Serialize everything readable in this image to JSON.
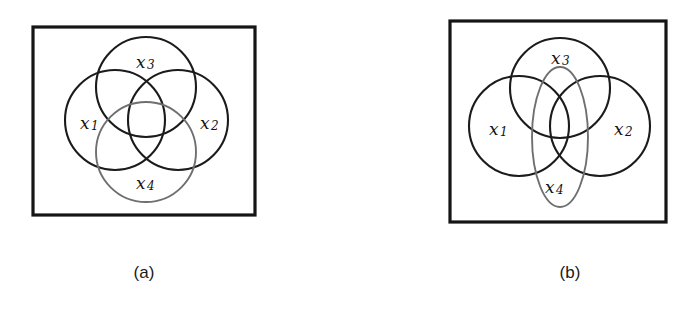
{
  "figure": {
    "background_color": "#ffffff",
    "stroke_dark": "#1b1b1b",
    "stroke_light": "#6f6f6f",
    "frame_color": "#151515",
    "panels": [
      {
        "id": "panel-a",
        "caption": "(a)",
        "caption_x": 144,
        "caption_y": 278,
        "frame": {
          "x": 33,
          "y": 27,
          "width": 222,
          "height": 188
        },
        "shapes": [
          {
            "name": "x1",
            "type": "circle",
            "cx": 115,
            "cy": 120,
            "r": 50,
            "tone": "dark"
          },
          {
            "name": "x2",
            "type": "circle",
            "cx": 178,
            "cy": 120,
            "r": 50,
            "tone": "dark"
          },
          {
            "name": "x3",
            "type": "circle",
            "cx": 146,
            "cy": 87,
            "r": 50,
            "tone": "dark"
          },
          {
            "name": "x4",
            "type": "circle",
            "cx": 146,
            "cy": 152,
            "r": 50,
            "tone": "light"
          }
        ],
        "labels": [
          {
            "base": "x",
            "sub": "1",
            "x": 80,
            "y": 124
          },
          {
            "base": "x",
            "sub": "2",
            "x": 200,
            "y": 124
          },
          {
            "base": "x",
            "sub": "3",
            "x": 136,
            "y": 63
          },
          {
            "base": "x",
            "sub": "4",
            "x": 136,
            "y": 184
          }
        ]
      },
      {
        "id": "panel-b",
        "caption": "(b)",
        "caption_x": 570,
        "caption_y": 278,
        "frame": {
          "x": 450,
          "y": 21,
          "width": 216,
          "height": 201
        },
        "shapes": [
          {
            "name": "x1",
            "type": "circle",
            "cx": 519,
            "cy": 126,
            "r": 50,
            "tone": "dark"
          },
          {
            "name": "x2",
            "type": "circle",
            "cx": 600,
            "cy": 126,
            "r": 50,
            "tone": "dark"
          },
          {
            "name": "x3",
            "type": "circle",
            "cx": 560,
            "cy": 88,
            "r": 50,
            "tone": "dark"
          },
          {
            "name": "x4",
            "type": "ellipse",
            "cx": 560,
            "cy": 137,
            "rx": 28,
            "ry": 70,
            "tone": "light"
          }
        ],
        "labels": [
          {
            "base": "x",
            "sub": "1",
            "x": 489,
            "y": 130
          },
          {
            "base": "x",
            "sub": "2",
            "x": 614,
            "y": 130
          },
          {
            "base": "x",
            "sub": "3",
            "x": 551,
            "y": 59
          },
          {
            "base": "x",
            "sub": "4",
            "x": 545,
            "y": 188
          }
        ]
      }
    ]
  }
}
